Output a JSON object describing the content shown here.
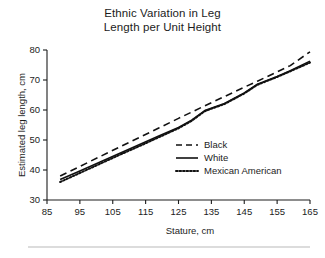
{
  "figure": {
    "title_lines": [
      "Ethnic Variation in Leg",
      "Length per Unit Height"
    ],
    "bottom_rule": true
  },
  "chart_data": {
    "type": "line",
    "title": "Ethnic Variation in Leg Length per Unit Height",
    "xlabel": "Stature, cm",
    "ylabel": "Estimated leg length, cm",
    "xlim": [
      85,
      165
    ],
    "ylim": [
      30,
      80
    ],
    "xticks": [
      85,
      95,
      105,
      115,
      125,
      135,
      145,
      155,
      165
    ],
    "yticks": [
      30,
      40,
      50,
      60,
      70,
      80
    ],
    "xtick_labels": [
      "85",
      "95",
      "105",
      "115",
      "125",
      "135",
      "145",
      "155",
      "165"
    ],
    "ytick_labels": [
      "30",
      "40",
      "50",
      "60",
      "70",
      "80"
    ],
    "grid": false,
    "legend_position": "center-right",
    "x": [
      89,
      95,
      101,
      107,
      113,
      119,
      125,
      129,
      133,
      139,
      145,
      149,
      155,
      159,
      165
    ],
    "series": [
      {
        "name": "Black",
        "linestyle": "dashed",
        "color": "#111111",
        "values": [
          38.0,
          41.2,
          44.4,
          47.6,
          50.8,
          54.0,
          57.2,
          59.3,
          61.4,
          64.5,
          67.6,
          69.6,
          72.7,
          74.8,
          79.4
        ]
      },
      {
        "name": "White",
        "linestyle": "solid",
        "color": "#111111",
        "values": [
          36.8,
          39.7,
          42.6,
          45.5,
          48.4,
          51.3,
          54.2,
          56.6,
          59.8,
          62.2,
          65.7,
          68.6,
          71.2,
          73.1,
          76.3
        ]
      },
      {
        "name": "Mexican American",
        "linestyle": "dotted",
        "color": "#111111",
        "values": [
          36.0,
          39.0,
          42.0,
          45.0,
          47.9,
          50.9,
          53.9,
          56.4,
          59.6,
          62.0,
          65.5,
          68.4,
          71.0,
          72.9,
          75.8
        ]
      }
    ],
    "legend": [
      {
        "label": "Black",
        "linestyle": "dashed"
      },
      {
        "label": "White",
        "linestyle": "solid"
      },
      {
        "label": "Mexican American",
        "linestyle": "dotted"
      }
    ]
  }
}
